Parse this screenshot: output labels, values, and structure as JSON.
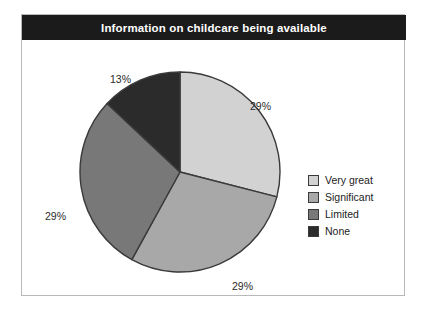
{
  "chart": {
    "title": "Information on childcare being available"
  },
  "chart_data": {
    "type": "pie",
    "title": "Information on childcare being available",
    "xlabel": "",
    "ylabel": "",
    "legend_position": "right",
    "grid": false,
    "categories": [
      "Very great",
      "Significant",
      "Limited",
      "None"
    ],
    "values": [
      29,
      29,
      29,
      13
    ],
    "value_labels": [
      "29%",
      "29%",
      "29%",
      "13%"
    ],
    "colors": [
      "#d2d2d2",
      "#a8a8a8",
      "#787878",
      "#2b2b2b"
    ],
    "slices": [
      {
        "label": "Very great",
        "value": 29,
        "display": "29%",
        "color": "#d2d2d2",
        "start_angle": 0,
        "end_angle": 104
      },
      {
        "label": "Significant",
        "value": 29,
        "display": "29%",
        "color": "#a8a8a8",
        "start_angle": 104,
        "end_angle": 208
      },
      {
        "label": "Limited",
        "value": 29,
        "display": "29%",
        "color": "#787878",
        "start_angle": 208,
        "end_angle": 313
      },
      {
        "label": "None",
        "value": 13,
        "display": "13%",
        "color": "#2b2b2b",
        "start_angle": 313,
        "end_angle": 360
      }
    ]
  },
  "labels": {
    "very_great_pct": "29%",
    "significant_pct": "29%",
    "limited_pct": "29%",
    "none_pct": "13%"
  },
  "legend": {
    "items": [
      {
        "label": "Very great",
        "color": "#d2d2d2"
      },
      {
        "label": "Significant",
        "color": "#a8a8a8"
      },
      {
        "label": "Limited",
        "color": "#787878"
      },
      {
        "label": "None",
        "color": "#2b2b2b"
      }
    ]
  },
  "colors": {
    "title_bar": "#1b1b1b",
    "title_text": "#ffffff",
    "frame_border": "#b9b9b9",
    "slice_outline": "#3a3a3a",
    "label_text": "#2a2a2a",
    "background": "#ffffff"
  }
}
